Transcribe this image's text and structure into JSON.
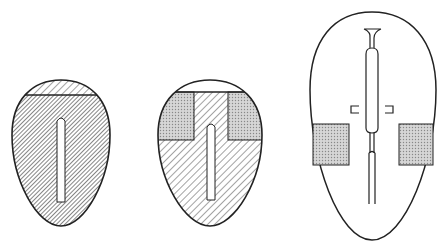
{
  "diagram": {
    "panels": [
      {
        "id": "left",
        "description": "egg shape, dark hatched body with lighter hatched top cap, central slot"
      },
      {
        "id": "middle",
        "description": "egg shape, hatched T-region, two dotted blocks at top corners, central slot"
      },
      {
        "id": "right",
        "description": "egg outline with central tube/pipette, two side brackets and two dotted blocks"
      }
    ],
    "colors": {
      "stroke": "#222222",
      "dotted_fill": "#c8c8c8",
      "background": "#ffffff"
    }
  }
}
